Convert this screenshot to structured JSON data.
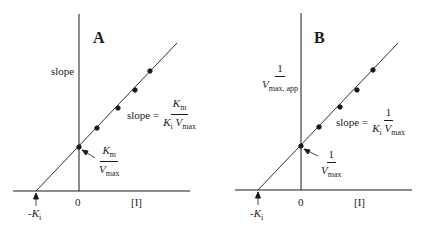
{
  "panels": [
    {
      "id": "A",
      "letter": "A",
      "y_label": "slope",
      "slope_eq": {
        "lhs": "slope =",
        "num_main": "K",
        "num_sub": "m",
        "den_a": "K",
        "den_a_sub": "i",
        "den_b": "V",
        "den_b_sub": "max"
      },
      "intercept": {
        "num_main": "K",
        "num_sub": "m",
        "den_main": "V",
        "den_sub": "max"
      },
      "x_intercept_label": {
        "prefix": "-",
        "main": "K",
        "sub": "i"
      },
      "origin_label": "0",
      "x_label": "[I]"
    },
    {
      "id": "B",
      "letter": "B",
      "y_label": {
        "num": "1",
        "den_main": "V",
        "den_sub": "max, app"
      },
      "slope_eq": {
        "lhs": "slope =",
        "num": "1",
        "den_a": "K",
        "den_a_sub": "i",
        "den_b": "V",
        "den_b_sub": "max"
      },
      "intercept": {
        "num": "1",
        "den_main": "V",
        "den_sub": "max"
      },
      "x_intercept_label": {
        "prefix": "-",
        "main": "K",
        "sub": "i"
      },
      "origin_label": "0",
      "x_label": "[I]"
    }
  ],
  "colors": {
    "ink": "#1a1a1a",
    "background": "#ffffff"
  }
}
